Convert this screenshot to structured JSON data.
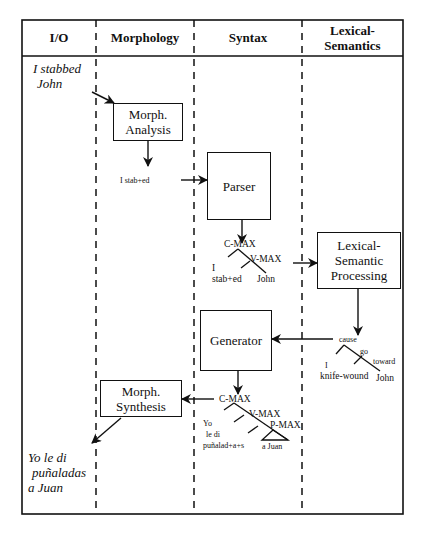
{
  "columns": [
    {
      "id": "io",
      "label": "I/O"
    },
    {
      "id": "morphology",
      "label": "Morphology"
    },
    {
      "id": "syntax",
      "label": "Syntax"
    },
    {
      "id": "lexical_semantics",
      "label_line1": "Lexical-",
      "label_line2": "Semantics"
    }
  ],
  "io": {
    "input_line1": "I stabbed",
    "input_line2": "John",
    "output_line1": "Yo le di",
    "output_line2": "puñaladas",
    "output_line3": "a Juan"
  },
  "boxes": {
    "morph_analysis": {
      "line1": "Morph.",
      "line2": "Analysis"
    },
    "parser": {
      "label": "Parser"
    },
    "lexical_semantic_processing": {
      "line1": "Lexical-",
      "line2": "Semantic",
      "line3": "Processing"
    },
    "generator": {
      "label": "Generator"
    },
    "morph_synthesis": {
      "line1": "Morph.",
      "line2": "Synthesis"
    }
  },
  "intermediate": {
    "morph_output": "I stab+ed",
    "parse_tree": {
      "root": "C-MAX",
      "child": "V-MAX",
      "subject": "I",
      "verb": "stab+ed",
      "object": "John"
    },
    "lcs_tree": {
      "root": "cause",
      "child1": "go",
      "child2": "toward",
      "subject": "I",
      "instrument": "knife-wound",
      "goal": "John"
    },
    "gen_tree": {
      "root": "C-MAX",
      "child1": "V-MAX",
      "child2": "P-MAX",
      "subject": "Yo",
      "clitic_verb": "le di",
      "noun": "puñalad+a+s",
      "pp": "a Juan"
    }
  }
}
